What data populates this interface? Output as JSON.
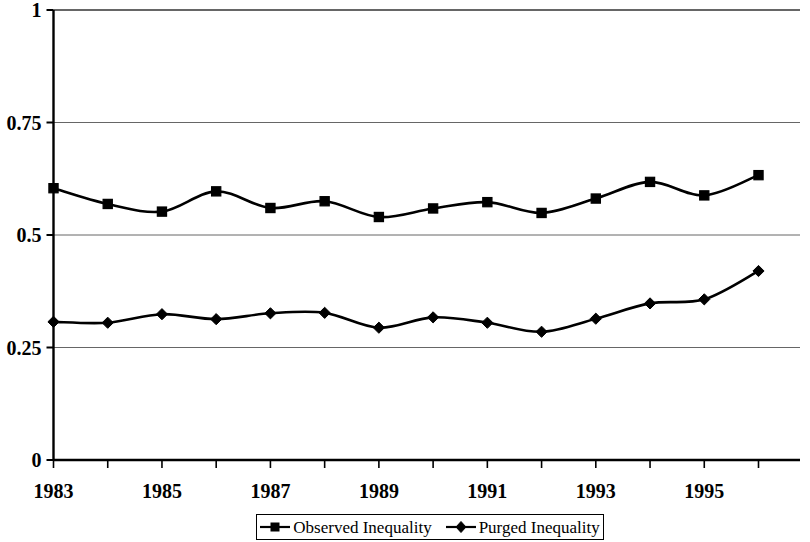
{
  "chart_data": {
    "type": "line",
    "title": "",
    "subtitle": "",
    "xlabel": "",
    "ylabel": "",
    "x": [
      1983,
      1984,
      1985,
      1986,
      1987,
      1988,
      1989,
      1990,
      1991,
      1992,
      1993,
      1994,
      1995,
      1996
    ],
    "categories": [
      "1983",
      "1984",
      "1985",
      "1986",
      "1987",
      "1988",
      "1989",
      "1990",
      "1991",
      "1992",
      "1993",
      "1994",
      "1995",
      "1996"
    ],
    "series": [
      {
        "name": "Observed Inequality",
        "marker": "square",
        "color": "#000000",
        "values": [
          0.604,
          0.569,
          0.552,
          0.597,
          0.56,
          0.575,
          0.54,
          0.559,
          0.573,
          0.549,
          0.581,
          0.618,
          0.588,
          0.633
        ]
      },
      {
        "name": "Purged Inequality",
        "marker": "diamond",
        "color": "#000000",
        "values": [
          0.307,
          0.305,
          0.324,
          0.313,
          0.326,
          0.327,
          0.294,
          0.317,
          0.305,
          0.285,
          0.314,
          0.348,
          0.357,
          0.42
        ]
      }
    ],
    "ylim": [
      0,
      1
    ],
    "xlim": [
      1983,
      1996
    ],
    "y_ticks": [
      0,
      0.25,
      0.5,
      0.75,
      1
    ],
    "y_tick_labels": [
      "0",
      "0.25",
      "0.5",
      "0.75",
      "1"
    ],
    "x_ticks": [
      1983,
      1984,
      1985,
      1986,
      1987,
      1988,
      1989,
      1990,
      1991,
      1992,
      1993,
      1994,
      1995,
      1996
    ],
    "x_tick_labels": [
      "1983",
      "",
      "1985",
      "",
      "1987",
      "",
      "1989",
      "",
      "1991",
      "",
      "1993",
      "",
      "1995",
      ""
    ],
    "x_tick_labels_visible": [
      "1983",
      "1985",
      "1987",
      "1989",
      "1991",
      "1993",
      "1995"
    ],
    "grid": {
      "horizontal": true,
      "vertical": false,
      "color": "#666666"
    },
    "legend": {
      "position": "bottom",
      "boxed": true,
      "entries": [
        {
          "label": "Observed Inequality",
          "marker": "square"
        },
        {
          "label": "Purged Inequality",
          "marker": "diamond"
        }
      ]
    }
  },
  "axes": {
    "y_labels": [
      {
        "text": "1",
        "value": 1
      },
      {
        "text": "0.75",
        "value": 0.75
      },
      {
        "text": "0.5",
        "value": 0.5
      },
      {
        "text": "0.25",
        "value": 0.25
      },
      {
        "text": "0",
        "value": 0
      }
    ],
    "x_labels": [
      {
        "text": "1983",
        "value": 1983
      },
      {
        "text": "1985",
        "value": 1985
      },
      {
        "text": "1987",
        "value": 1987
      },
      {
        "text": "1989",
        "value": 1989
      },
      {
        "text": "1991",
        "value": 1991
      },
      {
        "text": "1993",
        "value": 1993
      },
      {
        "text": "1995",
        "value": 1995
      }
    ]
  },
  "legend": {
    "entries": [
      {
        "label": "Observed Inequality",
        "marker": "square"
      },
      {
        "label": "Purged Inequality",
        "marker": "diamond"
      }
    ]
  },
  "colors": {
    "line": "#000000",
    "grid": "#666666",
    "axis": "#000000",
    "background": "#ffffff"
  }
}
